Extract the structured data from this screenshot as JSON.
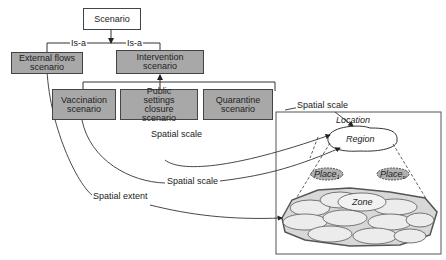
{
  "diagram": {
    "root": {
      "label": "Scenario"
    },
    "relations": {
      "is_a_left": "Is-a",
      "is_a_right": "Is-a"
    },
    "scenarios": {
      "external_flows": "External flows scenario",
      "intervention": "Intervention scenario",
      "vaccination": "Vaccination scenario",
      "public_settings": "Public settings closure scenario",
      "quarantine": "Quarantine scenario"
    },
    "edge_labels": {
      "quarantine_scale": "Spatial scale",
      "public_scale": "Spatial scale",
      "vaccination_scale": "Spatial scale",
      "external_extent": "Spatial extent"
    },
    "spatial": {
      "location": "Location",
      "region": "Region",
      "place_1": {
        "name": "Place",
        "sub": "1"
      },
      "place_n": {
        "name": "Place",
        "sub": "n"
      },
      "zone": "Zone"
    },
    "colors": {
      "gray_box": "#a8a8a8",
      "cell_fill": "#e6e6e6",
      "place_fill": "#b0b0b0"
    }
  }
}
